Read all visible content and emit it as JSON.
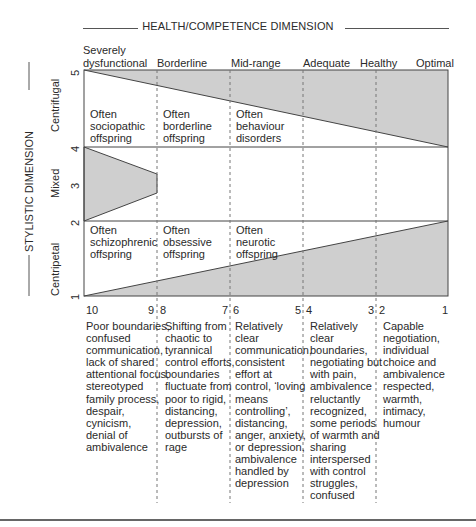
{
  "title": "HEALTH/COMPETENCE DIMENSION",
  "side_title": "STYLISTIC DIMENSION",
  "column_headers": [
    {
      "label_line1": "Severely",
      "label_line2": "dysfunctional"
    },
    {
      "label_line1": "",
      "label_line2": "Borderline"
    },
    {
      "label_line1": "",
      "label_line2": "Mid-range"
    },
    {
      "label_line1": "",
      "label_line2": "Adequate"
    },
    {
      "label_line1": "",
      "label_line2": "Healthy"
    },
    {
      "label_line1": "",
      "label_line2": "Optimal"
    }
  ],
  "y_axis": {
    "ticks": [
      "1",
      "2",
      "3",
      "4",
      "5"
    ],
    "zones": [
      "Centripetal",
      "Mixed",
      "Centrifugal"
    ]
  },
  "regions": {
    "centrifugal": [
      {
        "line1": "Often",
        "line2": "sociopathic",
        "line3": "offspring"
      },
      {
        "line1": "Often",
        "line2": "borderline",
        "line3": "offspring"
      },
      {
        "line1": "Often",
        "line2": "behaviour",
        "line3": "disorders"
      }
    ],
    "centripetal": [
      {
        "line1": "Often",
        "line2": "schizophrenic",
        "line3": "offspring"
      },
      {
        "line1": "Often",
        "line2": "obsessive",
        "line3": "offspring"
      },
      {
        "line1": "Often",
        "line2": "neurotic",
        "line3": "offspring"
      }
    ]
  },
  "scale": {
    "numbers": [
      "10",
      "9",
      "8",
      "7",
      "6",
      "5",
      "4",
      "3",
      "2",
      "1"
    ]
  },
  "descriptions": [
    [
      "Poor boundaries,",
      "confused",
      "communication,",
      "lack of shared",
      "attentional focus,",
      "stereotyped",
      "family process,",
      "despair,",
      "cynicism,",
      "denial of",
      "ambivalence"
    ],
    [
      "Shifting from",
      "chaotic to",
      "tyrannical",
      "control efforts,",
      "boundaries",
      "fluctuate from",
      "poor to rigid,",
      "distancing,",
      "depression,",
      "outbursts of",
      "rage"
    ],
    [
      "Relatively",
      "clear",
      "communication,",
      "consistent",
      "effort at",
      "control, ‘loving",
      "means",
      "controlling’,",
      "distancing,",
      "anger, anxiety,",
      "or depression,",
      "ambivalence",
      "handled by",
      "depression"
    ],
    [
      "Relatively",
      "clear",
      "boundaries,",
      "negotiating but",
      "with pain,",
      "ambivalence",
      "reluctantly",
      "recognized,",
      "some periods",
      "of warmth and",
      "sharing",
      "interspersed",
      "with control",
      "struggles,",
      "confused"
    ],
    [
      "Capable",
      "negotiation,",
      "individual",
      "choice and",
      "ambivalence",
      "respected,",
      "warmth,",
      "intimacy,",
      "humour"
    ]
  ],
  "colors": {
    "shade": "#cfcfcf",
    "line": "#444444",
    "dash": "#777777"
  }
}
